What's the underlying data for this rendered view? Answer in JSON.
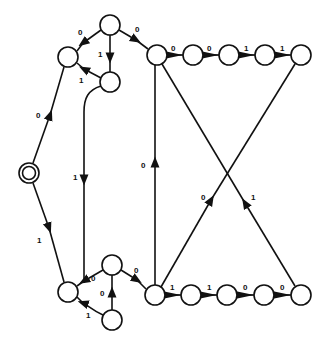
{
  "diagram": {
    "type": "finite-state-automaton",
    "start_node": "s0",
    "nodes": [
      {
        "id": "s0",
        "x": 29,
        "y": 173,
        "r": 10,
        "start": true
      },
      {
        "id": "a1",
        "x": 68,
        "y": 57,
        "r": 10
      },
      {
        "id": "a2",
        "x": 110,
        "y": 25,
        "r": 10
      },
      {
        "id": "a3",
        "x": 110,
        "y": 82,
        "r": 10
      },
      {
        "id": "t1",
        "x": 157,
        "y": 55,
        "r": 10
      },
      {
        "id": "t2",
        "x": 193,
        "y": 55,
        "r": 10
      },
      {
        "id": "t3",
        "x": 229,
        "y": 55,
        "r": 10
      },
      {
        "id": "t4",
        "x": 265,
        "y": 55,
        "r": 10
      },
      {
        "id": "t5",
        "x": 301,
        "y": 55,
        "r": 10
      },
      {
        "id": "b1",
        "x": 68,
        "y": 292,
        "r": 10
      },
      {
        "id": "b2",
        "x": 112,
        "y": 265,
        "r": 10
      },
      {
        "id": "b3",
        "x": 112,
        "y": 320,
        "r": 10
      },
      {
        "id": "u1",
        "x": 155,
        "y": 295,
        "r": 10
      },
      {
        "id": "u2",
        "x": 191,
        "y": 295,
        "r": 10
      },
      {
        "id": "u3",
        "x": 227,
        "y": 295,
        "r": 10
      },
      {
        "id": "u4",
        "x": 264,
        "y": 295,
        "r": 10
      },
      {
        "id": "u5",
        "x": 301,
        "y": 295,
        "r": 10
      }
    ],
    "edges": [
      {
        "from": "s0",
        "to": "a1",
        "label": "0",
        "lx": 38,
        "ly": 115
      },
      {
        "from": "a2",
        "to": "a1",
        "label": "0",
        "lx": 80,
        "ly": 34
      },
      {
        "from": "a2",
        "to": "a3",
        "label": "1",
        "lx": 100,
        "ly": 55
      },
      {
        "from": "a3",
        "to": "a1",
        "label": "1",
        "lx": 80,
        "ly": 82
      },
      {
        "from": "a2",
        "to": "t1",
        "label": "0",
        "lx": 138,
        "ly": 32
      },
      {
        "from": "t1",
        "to": "t2",
        "label": "0",
        "lx": 172,
        "ly": 50
      },
      {
        "from": "t2",
        "to": "t3",
        "label": "0",
        "lx": 209,
        "ly": 50
      },
      {
        "from": "t3",
        "to": "t4",
        "label": "1",
        "lx": 245,
        "ly": 50
      },
      {
        "from": "t4",
        "to": "t5",
        "label": "1",
        "lx": 281,
        "ly": 50
      },
      {
        "from": "a3",
        "to": "b1",
        "label": "1",
        "lx": 74,
        "ly": 180
      },
      {
        "from": "s0",
        "to": "b1",
        "label": "1",
        "lx": 38,
        "ly": 242
      },
      {
        "from": "b2",
        "to": "b1",
        "label": "0",
        "lx": 92,
        "ly": 281
      },
      {
        "from": "b3",
        "to": "b1",
        "label": "1",
        "lx": 86,
        "ly": 318
      },
      {
        "from": "b3",
        "to": "b2",
        "label": "0",
        "lx": 100,
        "ly": 297
      },
      {
        "from": "b2",
        "to": "u1",
        "label": "0",
        "lx": 135,
        "ly": 273
      },
      {
        "from": "u1",
        "to": "u2",
        "label": "1",
        "lx": 172,
        "ly": 290
      },
      {
        "from": "u2",
        "to": "u3",
        "label": "1",
        "lx": 209,
        "ly": 290
      },
      {
        "from": "u3",
        "to": "u4",
        "label": "0",
        "lx": 245,
        "ly": 290
      },
      {
        "from": "u4",
        "to": "u5",
        "label": "0",
        "lx": 282,
        "ly": 290
      },
      {
        "from": "u1",
        "to": "t1",
        "label": "0",
        "lx": 142,
        "ly": 168
      },
      {
        "from": "u1",
        "to": "t5",
        "label": "0",
        "lx": 203,
        "ly": 200
      },
      {
        "from": "u5",
        "to": "t1",
        "label": "1",
        "lx": 252,
        "ly": 200
      }
    ]
  },
  "labels": {
    "e_s0_a1": "0",
    "e_a2_a1": "0",
    "e_a2_a3": "1",
    "e_a3_a1": "1",
    "e_a2_t1": "0",
    "e_t1_t2": "0",
    "e_t2_t3": "0",
    "e_t3_t4": "1",
    "e_t4_t5": "1",
    "e_a3_b1": "1",
    "e_s0_b1": "1",
    "e_b2_b1": "0",
    "e_b3_b1": "1",
    "e_b3_b2": "0",
    "e_b2_u1": "0",
    "e_u1_u2": "1",
    "e_u2_u3": "1",
    "e_u3_u4": "0",
    "e_u4_u5": "0",
    "e_u1_t1": "0",
    "e_u1_t5": "0",
    "e_u5_t1": "1"
  }
}
